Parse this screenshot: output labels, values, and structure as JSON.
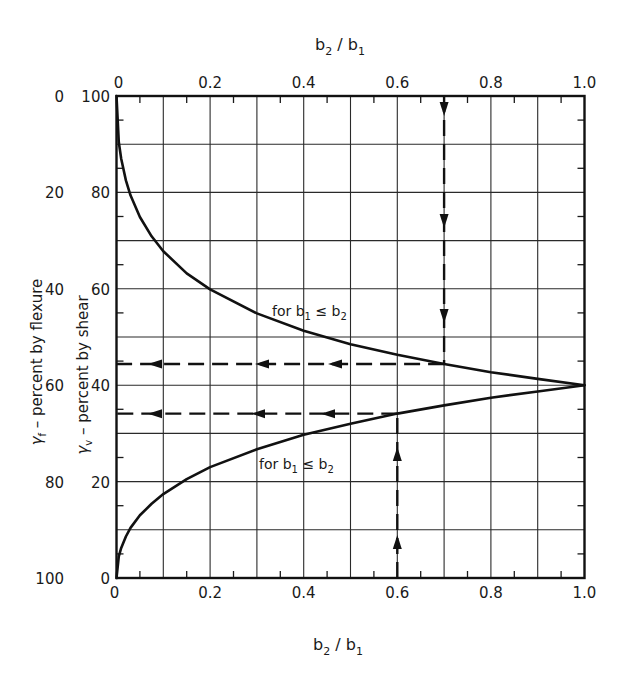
{
  "chart_data": {
    "type": "line",
    "title": "",
    "xlabel_top": "b2 / b1",
    "xlabel_bottom": "b2 / b1",
    "ylabel_outer": "γf – percent by flexure",
    "ylabel_inner": "γv – percent by shear",
    "xlim": [
      0,
      1.0
    ],
    "ylim": [
      0,
      100
    ],
    "grid": true,
    "x_ticks": [
      0,
      0.2,
      0.4,
      0.6,
      0.8,
      1.0
    ],
    "x_tick_labels": [
      "0",
      "0.2",
      "0.4",
      "0.6",
      "0.8",
      "1.0"
    ],
    "y_inner_ticks": [
      100,
      80,
      60,
      40,
      20,
      0
    ],
    "y_inner_tick_labels": [
      "100",
      "80",
      "60",
      "40",
      "20",
      "0"
    ],
    "y_outer_tick_labels": [
      "0",
      "20",
      "40",
      "60",
      "80",
      "100"
    ],
    "series": [
      {
        "name": "upper curve",
        "label": "for b1 ≤ b2",
        "x": [
          0,
          0.005,
          0.01,
          0.02,
          0.03,
          0.05,
          0.075,
          0.1,
          0.15,
          0.2,
          0.3,
          0.4,
          0.5,
          0.6,
          0.7,
          0.8,
          0.9,
          1.0
        ],
        "y": [
          100,
          90.4,
          87.0,
          82.5,
          79.4,
          74.9,
          70.9,
          67.8,
          63.2,
          59.9,
          54.9,
          51.3,
          48.5,
          46.3,
          44.4,
          42.7,
          41.3,
          40
        ]
      },
      {
        "name": "lower curve",
        "label": "for b1 ≤ b2",
        "x": [
          0,
          0.005,
          0.01,
          0.02,
          0.03,
          0.05,
          0.075,
          0.1,
          0.15,
          0.2,
          0.3,
          0.4,
          0.5,
          0.6,
          0.7,
          0.8,
          0.9,
          1.0
        ],
        "y": [
          0,
          4.5,
          6.25,
          8.6,
          10.4,
          13.0,
          15.4,
          17.4,
          20.5,
          23.0,
          26.7,
          29.7,
          32.0,
          34.1,
          35.8,
          37.4,
          38.7,
          40
        ]
      }
    ],
    "annotations": [
      {
        "type": "dashed-arrow-path",
        "description": "down from top axis at b2/b1=0.7 to upper curve, then left to axis",
        "x": 0.7,
        "y": 44.4
      },
      {
        "type": "dashed-arrow-path",
        "description": "up from bottom axis at b2/b1=0.6 to lower curve, then left to axis",
        "x": 0.6,
        "y": 34.1
      }
    ]
  },
  "labels": {
    "top_axis_title": "b2 / b1",
    "bottom_axis_title": "b2 / b1",
    "upper_curve_label": "for b1 ≤ b2",
    "lower_curve_label": "for b1 ≤ b2"
  }
}
